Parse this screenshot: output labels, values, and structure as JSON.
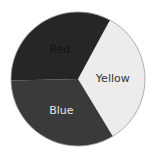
{
  "chart_data": {
    "type": "pie",
    "title": "",
    "categories": [
      "Yellow",
      "Blue",
      "Red"
    ],
    "values": [
      33.4,
      33.3,
      33.3
    ],
    "start_angle_deg": 28.5,
    "direction": "clockwise",
    "legend": "none",
    "labels_inside": true,
    "slices": [
      {
        "label": "Yellow",
        "value": 33.4,
        "fill": "#ececec",
        "label_color": "#333333"
      },
      {
        "label": "Blue",
        "value": 33.3,
        "fill": "#3a3a3a",
        "label_color": "#e6e6e6"
      },
      {
        "label": "Red",
        "value": 33.3,
        "fill": "#262626",
        "label_color": "#141414"
      }
    ]
  },
  "geometry": {
    "cx": 78,
    "cy": 79,
    "r": 67
  },
  "colors": {
    "border": "#9a9a9a",
    "background": "#ffffff"
  }
}
